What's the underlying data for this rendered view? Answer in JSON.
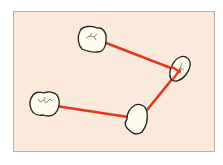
{
  "diagram": {
    "colors": {
      "panel_fill": "#fbe9dc",
      "panel_border": "#b9b2ab",
      "tooth_fill": "#fdfbeb",
      "tooth_outline": "#1e1e1e",
      "connector": "#e8381c",
      "fissure": "#5a5a5a"
    },
    "nodes": [
      {
        "id": "tooth-upper-left",
        "shape": "molar",
        "has_fissure": true
      },
      {
        "id": "tooth-right",
        "shape": "premolar",
        "has_fissure": true
      },
      {
        "id": "tooth-lower-middle",
        "shape": "canine",
        "has_fissure": false
      },
      {
        "id": "tooth-lower-left",
        "shape": "molar",
        "has_fissure": true
      }
    ],
    "connections": [
      {
        "from": "tooth-upper-left",
        "to": "tooth-right"
      },
      {
        "from": "tooth-right",
        "to": "tooth-lower-middle"
      },
      {
        "from": "tooth-lower-middle",
        "to": "tooth-lower-left"
      }
    ]
  }
}
